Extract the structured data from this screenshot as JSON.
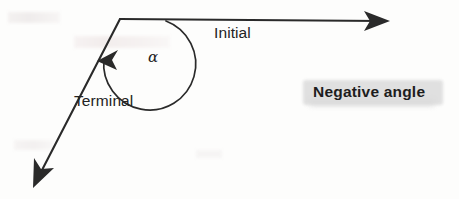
{
  "figure": {
    "background_color": "#fdfdfc",
    "ink_color": "#2a2a2a",
    "highlight_color": "#dedede",
    "labels": {
      "initial": "Initial",
      "terminal": "Terminal",
      "angle_symbol": "α",
      "caption": "Negative angle"
    },
    "geometry": {
      "vertex": [
        120,
        19
      ],
      "initial_ray_end": [
        390,
        21
      ],
      "terminal_ray_end": [
        33,
        188
      ],
      "arc_start": [
        166,
        21
      ],
      "arc_end": [
        98,
        61
      ],
      "arc_sweep": "clockwise",
      "initial_arrow_direction": "right",
      "terminal_arrow_direction": "down-left",
      "arc_arrow_direction": "left"
    }
  }
}
